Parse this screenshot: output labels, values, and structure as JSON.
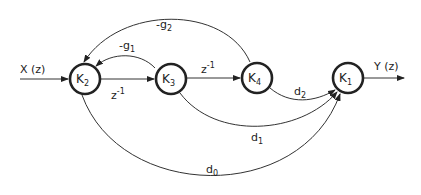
{
  "diagram": {
    "type": "signal-flow-graph",
    "input_label": "X (z)",
    "output_label": "Y (z)",
    "nodes": [
      {
        "id": "K2",
        "base": "K",
        "sub": "2"
      },
      {
        "id": "K3",
        "base": "K",
        "sub": "3"
      },
      {
        "id": "K4",
        "base": "K",
        "sub": "4"
      },
      {
        "id": "K1",
        "base": "K",
        "sub": "1"
      }
    ],
    "edges": [
      {
        "from": "X",
        "to": "K2",
        "base": "",
        "sub": ""
      },
      {
        "from": "K2",
        "to": "K3",
        "base": "z",
        "sup": "-1"
      },
      {
        "from": "K3",
        "to": "K4",
        "base": "z",
        "sup": "-1"
      },
      {
        "from": "K3",
        "to": "K2",
        "base": "-g",
        "sub": "1"
      },
      {
        "from": "K4",
        "to": "K2",
        "base": "-g",
        "sub": "2"
      },
      {
        "from": "K4",
        "to": "K1",
        "base": "d",
        "sub": "2"
      },
      {
        "from": "K3",
        "to": "K1",
        "base": "d",
        "sub": "1"
      },
      {
        "from": "K2",
        "to": "K1",
        "base": "d",
        "sub": "0"
      },
      {
        "from": "K1",
        "to": "Y",
        "base": "",
        "sub": ""
      }
    ]
  }
}
